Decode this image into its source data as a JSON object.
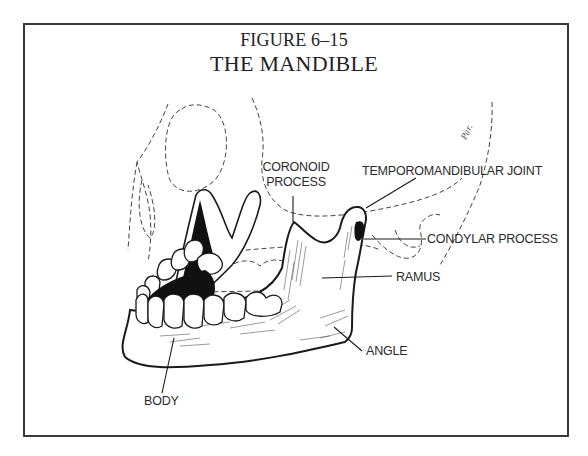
{
  "figure": {
    "number": "FIGURE 6–15",
    "title": "THE MANDIBLE"
  },
  "labels": {
    "coronoid_line1": "CORONOID",
    "coronoid_line2": "PROCESS",
    "tmj": "TEMPOROMANDIBULAR JOINT",
    "condylar": "CONDYLAR PROCESS",
    "ramus": "RAMUS",
    "angle": "ANGLE",
    "body": "BODY"
  },
  "colors": {
    "ink": "#1a1a1a",
    "frame": "#3a3a3a",
    "background": "#ffffff"
  }
}
